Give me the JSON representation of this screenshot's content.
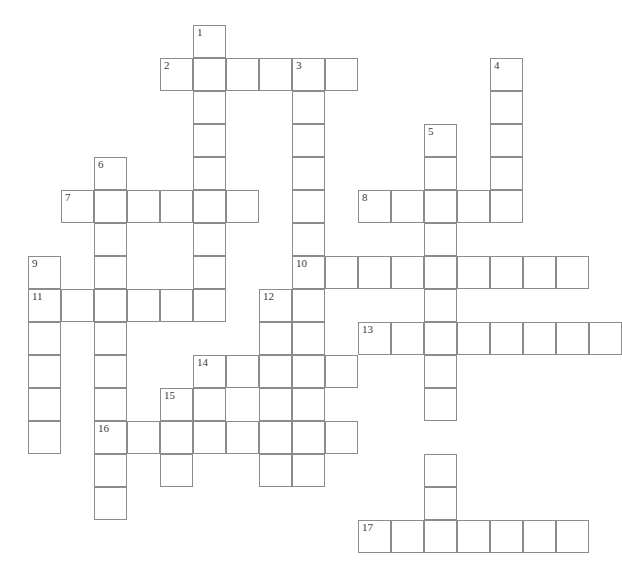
{
  "puzzle": {
    "type": "crossword-grid",
    "title": "",
    "geometry": {
      "cell_size": 33,
      "origin_x": 28,
      "origin_y": 25,
      "columns": 18,
      "rows": 16,
      "border_color": "#8c8c8c",
      "cell_fill": "#ffffff",
      "background": "#ffffff",
      "number_color": "#3a3a3a"
    },
    "total_numbered_entries": 17,
    "entries": [
      {
        "number": "1",
        "direction": "down",
        "col": 5,
        "row": 0,
        "length": 9
      },
      {
        "number": "2",
        "direction": "across",
        "col": 4,
        "row": 1,
        "length": 6
      },
      {
        "number": "3",
        "direction": "down",
        "col": 8,
        "row": 1,
        "length": 13
      },
      {
        "number": "4",
        "direction": "down",
        "col": 14,
        "row": 1,
        "length": 5
      },
      {
        "number": "5",
        "direction": "down",
        "col": 12,
        "row": 3,
        "length": 13
      },
      {
        "number": "6",
        "direction": "down",
        "col": 2,
        "row": 4,
        "length": 12
      },
      {
        "number": "7",
        "direction": "across",
        "col": 1,
        "row": 5,
        "length": 6
      },
      {
        "number": "8",
        "direction": "across",
        "col": 10,
        "row": 5,
        "length": 5
      },
      {
        "number": "9",
        "direction": "down",
        "col": 0,
        "row": 7,
        "length": 6
      },
      {
        "number": "10",
        "direction": "across",
        "col": 8,
        "row": 7,
        "length": 9
      },
      {
        "number": "11",
        "direction": "across",
        "col": 0,
        "row": 8,
        "length": 6
      },
      {
        "number": "12",
        "direction": "down",
        "col": 7,
        "row": 8,
        "length": 7
      },
      {
        "number": "13",
        "direction": "across",
        "col": 10,
        "row": 9,
        "length": 8
      },
      {
        "number": "14",
        "direction": "across",
        "col": 5,
        "row": 10,
        "length": 5
      },
      {
        "number": "15",
        "direction": "down",
        "col": 4,
        "row": 11,
        "length": 3
      },
      {
        "number": "16",
        "direction": "across",
        "col": 2,
        "row": 12,
        "length": 8
      },
      {
        "number": "17",
        "direction": "across",
        "col": 10,
        "row": 15,
        "length": 7
      }
    ],
    "cells": [
      {
        "col": 5,
        "row": 0,
        "number": "1"
      },
      {
        "col": 4,
        "row": 1,
        "number": "2"
      },
      {
        "col": 5,
        "row": 1,
        "number": ""
      },
      {
        "col": 6,
        "row": 1,
        "number": ""
      },
      {
        "col": 7,
        "row": 1,
        "number": ""
      },
      {
        "col": 8,
        "row": 1,
        "number": "3"
      },
      {
        "col": 9,
        "row": 1,
        "number": ""
      },
      {
        "col": 14,
        "row": 1,
        "number": "4"
      },
      {
        "col": 5,
        "row": 2,
        "number": ""
      },
      {
        "col": 8,
        "row": 2,
        "number": ""
      },
      {
        "col": 14,
        "row": 2,
        "number": ""
      },
      {
        "col": 5,
        "row": 3,
        "number": ""
      },
      {
        "col": 8,
        "row": 3,
        "number": ""
      },
      {
        "col": 12,
        "row": 3,
        "number": "5"
      },
      {
        "col": 14,
        "row": 3,
        "number": ""
      },
      {
        "col": 2,
        "row": 4,
        "number": "6"
      },
      {
        "col": 5,
        "row": 4,
        "number": ""
      },
      {
        "col": 8,
        "row": 4,
        "number": ""
      },
      {
        "col": 12,
        "row": 4,
        "number": ""
      },
      {
        "col": 14,
        "row": 4,
        "number": ""
      },
      {
        "col": 1,
        "row": 5,
        "number": "7"
      },
      {
        "col": 2,
        "row": 5,
        "number": ""
      },
      {
        "col": 3,
        "row": 5,
        "number": ""
      },
      {
        "col": 4,
        "row": 5,
        "number": ""
      },
      {
        "col": 5,
        "row": 5,
        "number": ""
      },
      {
        "col": 6,
        "row": 5,
        "number": ""
      },
      {
        "col": 8,
        "row": 5,
        "number": ""
      },
      {
        "col": 10,
        "row": 5,
        "number": "8"
      },
      {
        "col": 11,
        "row": 5,
        "number": ""
      },
      {
        "col": 12,
        "row": 5,
        "number": ""
      },
      {
        "col": 13,
        "row": 5,
        "number": ""
      },
      {
        "col": 14,
        "row": 5,
        "number": ""
      },
      {
        "col": 2,
        "row": 6,
        "number": ""
      },
      {
        "col": 5,
        "row": 6,
        "number": ""
      },
      {
        "col": 8,
        "row": 6,
        "number": ""
      },
      {
        "col": 12,
        "row": 6,
        "number": ""
      },
      {
        "col": 0,
        "row": 7,
        "number": "9"
      },
      {
        "col": 2,
        "row": 7,
        "number": ""
      },
      {
        "col": 5,
        "row": 7,
        "number": ""
      },
      {
        "col": 8,
        "row": 7,
        "number": "10"
      },
      {
        "col": 9,
        "row": 7,
        "number": ""
      },
      {
        "col": 10,
        "row": 7,
        "number": ""
      },
      {
        "col": 11,
        "row": 7,
        "number": ""
      },
      {
        "col": 12,
        "row": 7,
        "number": ""
      },
      {
        "col": 13,
        "row": 7,
        "number": ""
      },
      {
        "col": 14,
        "row": 7,
        "number": ""
      },
      {
        "col": 15,
        "row": 7,
        "number": ""
      },
      {
        "col": 16,
        "row": 7,
        "number": ""
      },
      {
        "col": 0,
        "row": 8,
        "number": "11"
      },
      {
        "col": 1,
        "row": 8,
        "number": ""
      },
      {
        "col": 2,
        "row": 8,
        "number": ""
      },
      {
        "col": 3,
        "row": 8,
        "number": ""
      },
      {
        "col": 4,
        "row": 8,
        "number": ""
      },
      {
        "col": 5,
        "row": 8,
        "number": ""
      },
      {
        "col": 7,
        "row": 8,
        "number": "12"
      },
      {
        "col": 8,
        "row": 8,
        "number": ""
      },
      {
        "col": 12,
        "row": 8,
        "number": ""
      },
      {
        "col": 0,
        "row": 9,
        "number": ""
      },
      {
        "col": 2,
        "row": 9,
        "number": ""
      },
      {
        "col": 7,
        "row": 9,
        "number": ""
      },
      {
        "col": 8,
        "row": 9,
        "number": ""
      },
      {
        "col": 10,
        "row": 9,
        "number": "13"
      },
      {
        "col": 11,
        "row": 9,
        "number": ""
      },
      {
        "col": 12,
        "row": 9,
        "number": ""
      },
      {
        "col": 13,
        "row": 9,
        "number": ""
      },
      {
        "col": 14,
        "row": 9,
        "number": ""
      },
      {
        "col": 15,
        "row": 9,
        "number": ""
      },
      {
        "col": 16,
        "row": 9,
        "number": ""
      },
      {
        "col": 17,
        "row": 9,
        "number": ""
      },
      {
        "col": 0,
        "row": 10,
        "number": ""
      },
      {
        "col": 2,
        "row": 10,
        "number": ""
      },
      {
        "col": 5,
        "row": 10,
        "number": "14"
      },
      {
        "col": 6,
        "row": 10,
        "number": ""
      },
      {
        "col": 7,
        "row": 10,
        "number": ""
      },
      {
        "col": 8,
        "row": 10,
        "number": ""
      },
      {
        "col": 9,
        "row": 10,
        "number": ""
      },
      {
        "col": 12,
        "row": 10,
        "number": ""
      },
      {
        "col": 0,
        "row": 11,
        "number": ""
      },
      {
        "col": 2,
        "row": 11,
        "number": ""
      },
      {
        "col": 4,
        "row": 11,
        "number": "15"
      },
      {
        "col": 5,
        "row": 11,
        "number": ""
      },
      {
        "col": 7,
        "row": 11,
        "number": ""
      },
      {
        "col": 8,
        "row": 11,
        "number": ""
      },
      {
        "col": 12,
        "row": 11,
        "number": ""
      },
      {
        "col": 0,
        "row": 12,
        "number": ""
      },
      {
        "col": 2,
        "row": 12,
        "number": "16"
      },
      {
        "col": 3,
        "row": 12,
        "number": ""
      },
      {
        "col": 4,
        "row": 12,
        "number": ""
      },
      {
        "col": 5,
        "row": 12,
        "number": ""
      },
      {
        "col": 6,
        "row": 12,
        "number": ""
      },
      {
        "col": 7,
        "row": 12,
        "number": ""
      },
      {
        "col": 8,
        "row": 12,
        "number": ""
      },
      {
        "col": 9,
        "row": 12,
        "number": ""
      },
      {
        "col": 2,
        "row": 13,
        "number": ""
      },
      {
        "col": 4,
        "row": 13,
        "number": ""
      },
      {
        "col": 7,
        "row": 13,
        "number": ""
      },
      {
        "col": 8,
        "row": 13,
        "number": ""
      },
      {
        "col": 12,
        "row": 13,
        "number": ""
      },
      {
        "col": 2,
        "row": 14,
        "number": ""
      },
      {
        "col": 12,
        "row": 14,
        "number": ""
      },
      {
        "col": 10,
        "row": 15,
        "number": "17"
      },
      {
        "col": 11,
        "row": 15,
        "number": ""
      },
      {
        "col": 12,
        "row": 15,
        "number": ""
      },
      {
        "col": 13,
        "row": 15,
        "number": ""
      },
      {
        "col": 14,
        "row": 15,
        "number": ""
      },
      {
        "col": 15,
        "row": 15,
        "number": ""
      },
      {
        "col": 16,
        "row": 15,
        "number": ""
      }
    ]
  }
}
